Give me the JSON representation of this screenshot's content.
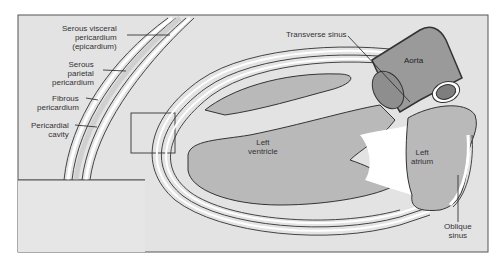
{
  "diagram": {
    "colors": {
      "background": "#e3e3e3",
      "frame": "#555555",
      "muscle": "#b9b9b9",
      "vessel": "#9a9a9a",
      "vessel_dark": "#7e7e7e",
      "cavity_white": "#ffffff",
      "line": "#333333"
    },
    "labels": {
      "serous_visceral_1": "Serous visceral",
      "serous_visceral_2": "pericardium",
      "serous_visceral_3": "(epicardium)",
      "serous_parietal_1": "Serous",
      "serous_parietal_2": "parietal",
      "serous_parietal_3": "pericardium",
      "fibrous_1": "Fibrous",
      "fibrous_2": "pericardium",
      "cavity_1": "Pericardial",
      "cavity_2": "cavity",
      "transverse_sinus": "Transverse sinus",
      "aorta": "Aorta",
      "left_ventricle_1": "Left",
      "left_ventricle_2": "ventricle",
      "left_atrium_1": "Left",
      "left_atrium_2": "atrium",
      "oblique_sinus_1": "Oblique",
      "oblique_sinus_2": "sinus"
    }
  }
}
